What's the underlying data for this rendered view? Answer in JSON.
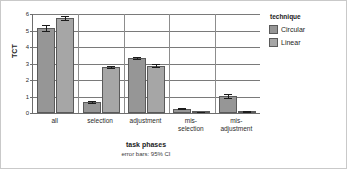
{
  "chart_data": {
    "type": "bar",
    "title": "",
    "xlabel": "task phases",
    "xsublabel": "error bars: 95% CI",
    "ylabel": "TCT",
    "ylim": [
      0,
      6
    ],
    "yticks": [
      0,
      1,
      2,
      3,
      4,
      5,
      6
    ],
    "ytick_labels": [
      "0",
      "1",
      "2",
      "3",
      "4",
      "5",
      "6"
    ],
    "grid": true,
    "legend_position": "right",
    "legend_title": "technique",
    "categories": [
      "all",
      "selection",
      "adjustment",
      "mis-\nselection",
      "mis-\nadjustment"
    ],
    "series": [
      {
        "name": "Circular",
        "color": "#969696",
        "values": [
          5.15,
          0.67,
          3.35,
          0.27,
          1.02
        ],
        "errors": [
          0.17,
          0.04,
          0.06,
          0.04,
          0.14
        ]
      },
      {
        "name": "Linear",
        "color": "#a6a6a6",
        "values": [
          5.75,
          2.78,
          2.87,
          0.07,
          0.1
        ],
        "errors": [
          0.13,
          0.05,
          0.09,
          0.02,
          0.03
        ]
      }
    ]
  },
  "legend": {
    "title": "technique",
    "items": [
      {
        "label": "Circular",
        "swatch": "circular"
      },
      {
        "label": "Linear",
        "swatch": "linear"
      }
    ]
  },
  "axes": {
    "y_title": "TCT",
    "x_title": "task phases",
    "x_subtitle": "error bars: 95% CI"
  }
}
